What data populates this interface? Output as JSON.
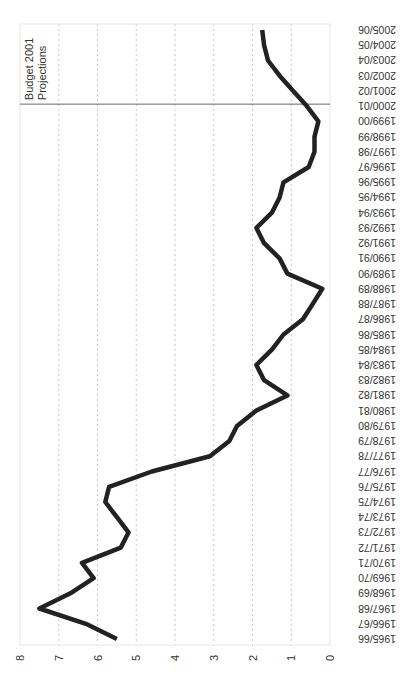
{
  "chart_data": {
    "type": "line",
    "orientation": "rotated-90-clockwise",
    "title": "",
    "xlabel": "",
    "ylabel": "",
    "ylim": [
      0,
      8
    ],
    "yticks": [
      "0",
      "1",
      "2",
      "3",
      "4",
      "5",
      "6",
      "7",
      "8"
    ],
    "grid": true,
    "legend": "none",
    "categories": [
      "1965/66",
      "1966/67",
      "1967/68",
      "1968/69",
      "1969/70",
      "1970/71",
      "1971/72",
      "1972/73",
      "1973/74",
      "1974/75",
      "1975/76",
      "1976/77",
      "1977/78",
      "1978/79",
      "1979/80",
      "1980/81",
      "1981/82",
      "1982/83",
      "1983/84",
      "1984/85",
      "1985/86",
      "1986/87",
      "1987/88",
      "1988/89",
      "1989/90",
      "1990/91",
      "1991/92",
      "1992/93",
      "1993/94",
      "1994/95",
      "1995/96",
      "1996/97",
      "1997/98",
      "1998/99",
      "1999/00",
      "2000/01",
      "2001/02",
      "2002/03",
      "2003/04",
      "2004/05",
      "2005/06"
    ],
    "series": [
      {
        "name": "value",
        "color": "#222222",
        "values": [
          5.5,
          6.3,
          7.5,
          6.7,
          6.1,
          6.4,
          5.4,
          5.2,
          5.5,
          5.8,
          5.7,
          4.6,
          3.1,
          2.6,
          2.4,
          1.9,
          1.1,
          1.7,
          1.9,
          1.5,
          1.2,
          0.7,
          0.45,
          0.2,
          1.1,
          1.3,
          1.7,
          1.9,
          1.5,
          1.3,
          1.2,
          0.55,
          0.4,
          0.4,
          0.3,
          0.6,
          0.95,
          1.3,
          1.6,
          1.7,
          1.75
        ]
      }
    ],
    "annotations": [
      {
        "text_lines": [
          "Budget 2001",
          "Projections"
        ],
        "at_category": "2000/01"
      }
    ]
  }
}
